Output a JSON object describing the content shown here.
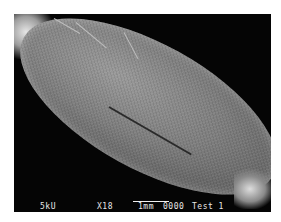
{
  "image": {
    "type": "SEM micrograph",
    "subject": "elongated seed/grain with hairs"
  },
  "overlay": {
    "voltage": "5kU",
    "magnification": "X18",
    "scale_label": "1mm",
    "image_number": "0000",
    "sample_label": "Test 1"
  }
}
